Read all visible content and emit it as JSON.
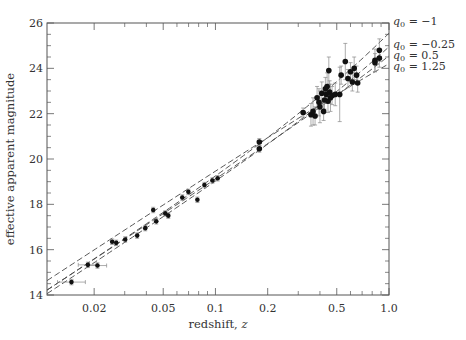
{
  "chart_data": {
    "type": "scatter",
    "title": "",
    "xlabel": "redshift, z",
    "ylabel": "effective apparent magnitude",
    "xscale": "log",
    "xlim": [
      0.0107,
      1.0
    ],
    "ylim": [
      14,
      26
    ],
    "x_tick_labels": [
      "0.02",
      "0.05",
      "0.1",
      "0.2",
      "0.5",
      "1.0"
    ],
    "x_ticks": [
      0.02,
      0.05,
      0.1,
      0.2,
      0.5,
      1.0
    ],
    "x_minor_ticks": [
      0.03,
      0.04,
      0.06,
      0.07,
      0.08,
      0.09,
      0.3,
      0.4,
      0.6,
      0.7,
      0.8,
      0.9
    ],
    "y_tick_labels": [
      "14",
      "16",
      "18",
      "20",
      "22",
      "24",
      "26"
    ],
    "y_ticks": [
      14,
      16,
      18,
      20,
      22,
      24,
      26
    ],
    "y_minor_step": 0.5,
    "grid": false,
    "legend_placement": "right of plot, line-end labels",
    "models": [
      {
        "name": "q0 = -1",
        "label_q": "q",
        "label_sub": "0",
        "label_rest": " = −1",
        "q0": -1,
        "m_at_z1": 25.55
      },
      {
        "name": "q0 = -0.25",
        "label_q": "q",
        "label_sub": "0",
        "label_rest": " = −0.25",
        "q0": -0.25,
        "m_at_z1": 24.95
      },
      {
        "name": "q0 = 0.5",
        "label_q": "q",
        "label_sub": "0",
        "label_rest": " = 0.5",
        "q0": 0.5,
        "m_at_z1": 24.55
      },
      {
        "name": "q0 = 1.25",
        "label_q": "q",
        "label_sub": "0",
        "label_rest": " = 1.25",
        "q0": 1.25,
        "m_at_z1": 24.2
      }
    ],
    "series": [
      {
        "name": "low-redshift supernovae",
        "points": [
          {
            "z": 0.0148,
            "m": 14.57,
            "zerr": [
              0.0123,
              0.0178
            ],
            "merr": 0.12
          },
          {
            "z": 0.0184,
            "m": 15.33,
            "zerr": [
              0.0162,
              0.0208
            ],
            "merr": 0.12
          },
          {
            "z": 0.0209,
            "m": 15.3,
            "zerr": [
              0.0186,
              0.0236
            ],
            "merr": 0.12
          },
          {
            "z": 0.0254,
            "m": 16.35,
            "zerr": null,
            "merr": 0.12
          },
          {
            "z": 0.0268,
            "m": 16.3,
            "zerr": null,
            "merr": 0.12
          },
          {
            "z": 0.0302,
            "m": 16.45,
            "zerr": null,
            "merr": 0.12
          },
          {
            "z": 0.0354,
            "m": 16.62,
            "zerr": null,
            "merr": 0.12
          },
          {
            "z": 0.0394,
            "m": 16.95,
            "zerr": null,
            "merr": 0.12
          },
          {
            "z": 0.0438,
            "m": 17.75,
            "zerr": null,
            "merr": 0.12
          },
          {
            "z": 0.0456,
            "m": 17.25,
            "zerr": null,
            "merr": 0.12
          },
          {
            "z": 0.0514,
            "m": 17.6,
            "zerr": null,
            "merr": 0.12
          },
          {
            "z": 0.0535,
            "m": 17.5,
            "zerr": null,
            "merr": 0.12
          },
          {
            "z": 0.0644,
            "m": 18.3,
            "zerr": null,
            "merr": 0.12
          },
          {
            "z": 0.0698,
            "m": 18.55,
            "zerr": null,
            "merr": 0.12
          },
          {
            "z": 0.0787,
            "m": 18.2,
            "zerr": null,
            "merr": 0.12
          },
          {
            "z": 0.0864,
            "m": 18.85,
            "zerr": null,
            "merr": 0.12
          },
          {
            "z": 0.096,
            "m": 19.05,
            "zerr": null,
            "merr": 0.12
          },
          {
            "z": 0.103,
            "m": 19.15,
            "zerr": null,
            "merr": 0.12
          }
        ]
      },
      {
        "name": "high-redshift supernovae",
        "points": [
          {
            "z": 0.179,
            "m": 20.75,
            "merr": 0.15
          },
          {
            "z": 0.179,
            "m": 20.45,
            "merr": 0.15
          },
          {
            "z": 0.32,
            "m": 22.05,
            "merr": 0.2
          },
          {
            "z": 0.355,
            "m": 21.95,
            "merr": 0.5
          },
          {
            "z": 0.365,
            "m": 22.1,
            "merr": 0.6
          },
          {
            "z": 0.375,
            "m": 21.9,
            "merr": 0.4
          },
          {
            "z": 0.385,
            "m": 22.7,
            "merr": 0.5
          },
          {
            "z": 0.395,
            "m": 22.5,
            "merr": 0.6
          },
          {
            "z": 0.4,
            "m": 22.3,
            "merr": 0.7
          },
          {
            "z": 0.41,
            "m": 22.9,
            "merr": 0.5
          },
          {
            "z": 0.42,
            "m": 22.1,
            "merr": 0.4
          },
          {
            "z": 0.425,
            "m": 22.6,
            "merr": 0.4
          },
          {
            "z": 0.43,
            "m": 23.1,
            "merr": 0.5
          },
          {
            "z": 0.435,
            "m": 22.85,
            "merr": 0.4
          },
          {
            "z": 0.44,
            "m": 23.2,
            "merr": 0.6
          },
          {
            "z": 0.445,
            "m": 22.55,
            "merr": 0.5
          },
          {
            "z": 0.45,
            "m": 23.9,
            "merr": 0.6
          },
          {
            "z": 0.455,
            "m": 22.95,
            "merr": 0.5
          },
          {
            "z": 0.46,
            "m": 22.7,
            "merr": 0.6
          },
          {
            "z": 0.47,
            "m": 22.8,
            "merr": 0.4
          },
          {
            "z": 0.49,
            "m": 22.85,
            "merr": 0.5
          },
          {
            "z": 0.52,
            "m": 22.85,
            "merr": 1.2
          },
          {
            "z": 0.53,
            "m": 23.7,
            "merr": 0.4
          },
          {
            "z": 0.56,
            "m": 24.3,
            "merr": 0.8
          },
          {
            "z": 0.58,
            "m": 23.55,
            "merr": 0.4
          },
          {
            "z": 0.6,
            "m": 23.85,
            "merr": 0.4
          },
          {
            "z": 0.615,
            "m": 23.4,
            "merr": 0.4
          },
          {
            "z": 0.63,
            "m": 24.0,
            "merr": 0.5
          },
          {
            "z": 0.65,
            "m": 23.7,
            "merr": 0.4
          },
          {
            "z": 0.66,
            "m": 23.35,
            "merr": 0.4
          },
          {
            "z": 0.83,
            "m": 24.35,
            "merr": 0.5
          },
          {
            "z": 0.83,
            "m": 24.25,
            "merr": 0.4
          },
          {
            "z": 0.88,
            "m": 24.8,
            "merr": 0.5
          },
          {
            "z": 0.88,
            "m": 24.45,
            "merr": 0.4
          }
        ]
      }
    ]
  },
  "colors": {
    "axis": "#555555",
    "marker": "#111111",
    "errorbar": "#888888",
    "model_line": "#444444",
    "text": "#333333"
  }
}
